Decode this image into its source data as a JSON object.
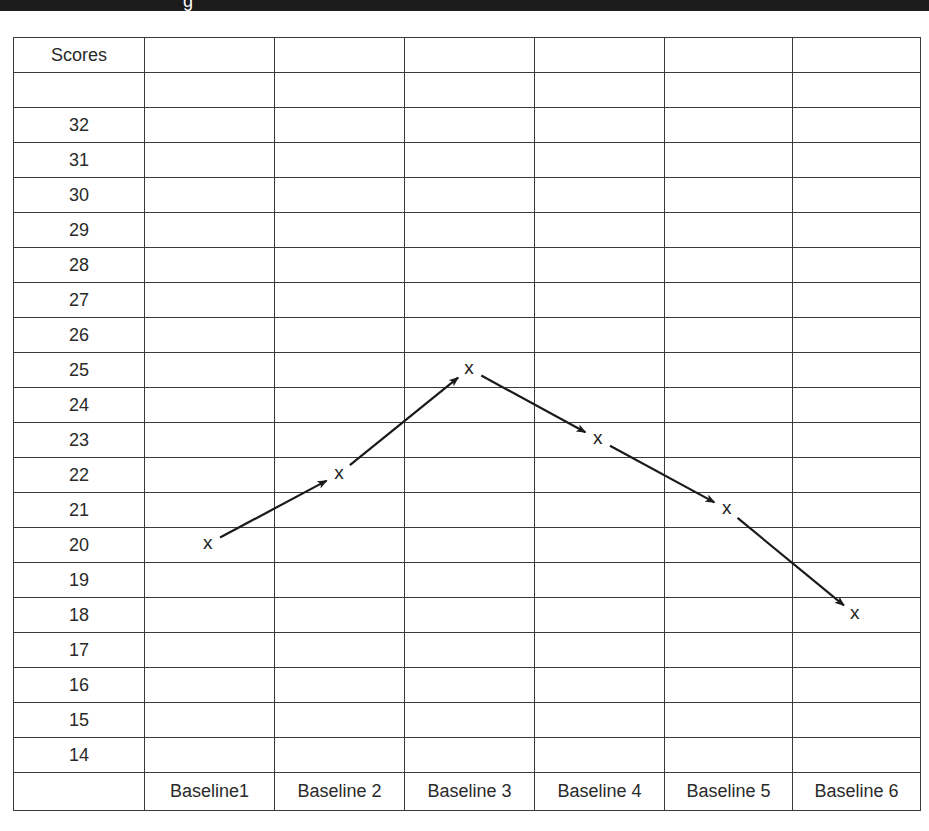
{
  "header": {
    "fragment": "g"
  },
  "table": {
    "corner_label": "Scores",
    "score_rows": [
      "32",
      "31",
      "30",
      "29",
      "28",
      "27",
      "26",
      "25",
      "24",
      "23",
      "22",
      "21",
      "20",
      "19",
      "18",
      "17",
      "16",
      "15",
      "14"
    ],
    "column_labels": [
      "Baseline1",
      "Baseline 2",
      "Baseline 3",
      "Baseline 4",
      "Baseline 5",
      "Baseline 6"
    ],
    "marker_glyph": "x"
  },
  "chart_data": {
    "type": "line",
    "title": "",
    "xlabel": "",
    "ylabel": "Scores",
    "categories": [
      "Baseline1",
      "Baseline 2",
      "Baseline 3",
      "Baseline 4",
      "Baseline 5",
      "Baseline 6"
    ],
    "series": [
      {
        "name": "Scores",
        "values": [
          20,
          22,
          25,
          23,
          21,
          18
        ],
        "marker": "x",
        "connector": "arrow"
      }
    ],
    "ylim": [
      14,
      32
    ],
    "yticks": [
      32,
      31,
      30,
      29,
      28,
      27,
      26,
      25,
      24,
      23,
      22,
      21,
      20,
      19,
      18,
      17,
      16,
      15,
      14
    ],
    "grid": true,
    "legend": "none"
  }
}
